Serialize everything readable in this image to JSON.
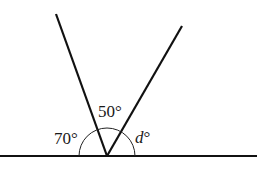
{
  "diagram": {
    "type": "angles-on-a-straight-line",
    "colors": {
      "stroke": "#111111",
      "background": "#ffffff"
    },
    "vertex": {
      "x": 107,
      "y": 156
    },
    "baseline": {
      "x1": 0,
      "x2": 257,
      "y": 156
    },
    "rays": [
      {
        "name": "left-ray",
        "to": {
          "x": 56,
          "y": 14
        }
      },
      {
        "name": "right-ray",
        "to": {
          "x": 182,
          "y": 26
        }
      }
    ],
    "arc_radius": 28,
    "labels": {
      "left_angle": {
        "text": "70°",
        "value": 70
      },
      "middle_angle": {
        "text": "50°",
        "value": 50
      },
      "right_angle": {
        "text": "d°",
        "symbol": "d",
        "degree": "°"
      }
    }
  }
}
